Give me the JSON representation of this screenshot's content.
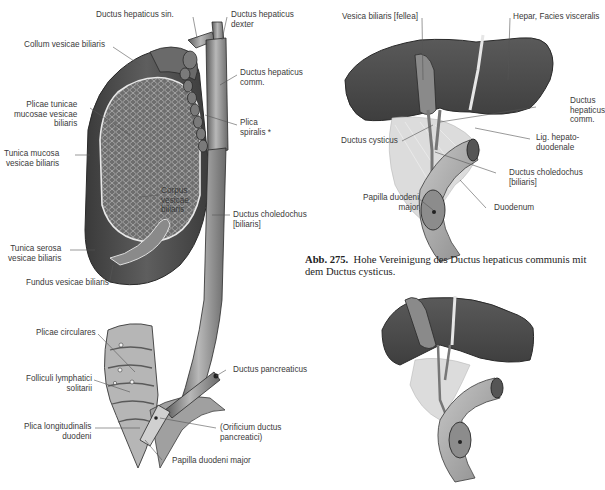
{
  "figure_left": {
    "labels": {
      "ductus_hepaticus_sin": "Ductus hepaticus sin.",
      "ductus_hepaticus_dexter": "Ductus hepaticus\ndexter",
      "collum_vesicae": "Collum vesicae biliaris",
      "ductus_hepaticus_comm": "Ductus hepaticus\ncomm.",
      "plicae_tunicae": "Plicae tunicae\nmucosae vesicae\nbiliaris",
      "plica_spiralis": "Plica\nspiralis *",
      "tunica_mucosa": "Tunica mucosa\nvesicae biliaris",
      "corpus_vesicae": "Corpus\nvesicae\nbiliaris",
      "ductus_choledochus": "Ductus choledochus\n[biliaris]",
      "tunica_serosa": "Tunica serosa\nvesicae biliaris",
      "fundus_vesicae": "Fundus vesicae biliaris",
      "plicae_circulares": "Plicae circulares",
      "ductus_pancreaticus": "Ductus pancreaticus",
      "folliculi": "Folliculi lymphatici\nsolitarii",
      "plica_longitudinalis": "Plica longitudinalis\nduodeni",
      "orificium": "(Orificium ductus\npancreatici)",
      "papilla_major": "Papilla duodeni major"
    }
  },
  "figure_right_top": {
    "labels": {
      "vesica_biliaris": "Vesica biliaris [fellea]",
      "hepar": "Hepar, Facies visceralis",
      "ductus_hepaticus_comm": "Ductus\nhepaticus\ncomm.",
      "ductus_cysticus": "Ductus cysticus",
      "lig_hepatoduodenale": "Lig. hepato-\nduodenale",
      "ductus_choledochus": "Ductus choledochus\n[biliaris]",
      "papilla_major": "Papilla duodeni\nmajor",
      "duodenum": "Duodenum"
    }
  },
  "caption": {
    "number": "Abb. 275.",
    "text": "Hohe Vereinigung des Ductus hepaticus communis mit dem Ductus cysticus."
  },
  "colors": {
    "liver": "#4a4a4a",
    "gallbladder": "#5a5a5a",
    "duct": "#9a9a9a",
    "label": "#3a3a3a"
  }
}
